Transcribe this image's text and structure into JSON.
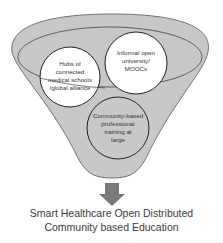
{
  "diagram": {
    "type": "funnel",
    "colors": {
      "funnel_fill": "#c8c8c8",
      "funnel_stroke": "#555555",
      "circle_fill": "#ffffff",
      "circle_stroke": "#222222",
      "arrow_fill": "#7a7a7a",
      "text": "#333333"
    },
    "circles": [
      {
        "id": "hubs",
        "lines": [
          "Hubs of",
          "connected",
          "medical schools",
          "/global alliance"
        ]
      },
      {
        "id": "informal",
        "lines": [
          "Informal open",
          "university/",
          "MOOCs"
        ]
      },
      {
        "id": "community",
        "lines": [
          "Community-based",
          "professional",
          "training at",
          "large"
        ]
      }
    ],
    "output": {
      "line1": "Smart Healthcare Open Distributed",
      "line2": "Community based Education"
    }
  }
}
